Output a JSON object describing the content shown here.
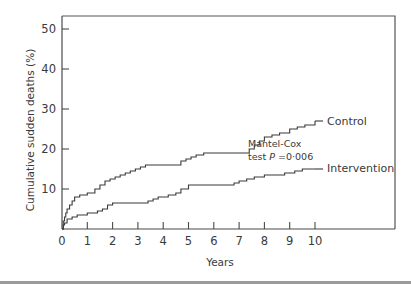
{
  "chart_data": {
    "type": "line",
    "step": true,
    "title": "",
    "xlabel": "Years",
    "ylabel": "Cumulative sudden deaths (%)",
    "xlim": [
      0,
      13.3
    ],
    "ylim": [
      0,
      53
    ],
    "xticks": [
      0,
      1,
      2,
      3,
      4,
      5,
      6,
      7,
      8,
      9,
      10
    ],
    "xtick_labels": [
      "0",
      "1",
      "2",
      "3",
      "4",
      "5",
      "6",
      "7",
      "8",
      "9",
      "10"
    ],
    "yticks": [
      10,
      20,
      30,
      40,
      50
    ],
    "ytick_labels": [
      "10",
      "20",
      "30",
      "40",
      "50"
    ],
    "grid": false,
    "series": [
      {
        "name": "Control",
        "x": [
          0,
          0.05,
          0.1,
          0.15,
          0.2,
          0.3,
          0.4,
          0.5,
          0.7,
          1.0,
          1.3,
          1.5,
          1.7,
          1.9,
          2.1,
          2.3,
          2.5,
          2.7,
          2.9,
          3.1,
          3.3,
          3.5,
          4.7,
          4.9,
          5.1,
          5.3,
          5.6,
          5.9,
          7.4,
          7.6,
          7.8,
          8.0,
          8.3,
          8.6,
          9.0,
          9.3,
          9.6,
          10.0
        ],
        "y": [
          0,
          2,
          3,
          4,
          5,
          6,
          7,
          8,
          8.5,
          9,
          10,
          11,
          12,
          12.5,
          13,
          13.5,
          14,
          14.5,
          15,
          15.5,
          16,
          16,
          17,
          17.5,
          18,
          18.5,
          19,
          19,
          20,
          21,
          22,
          23,
          23.5,
          24,
          25,
          25.5,
          26,
          27
        ]
      },
      {
        "name": "Intervention",
        "x": [
          0,
          0.05,
          0.1,
          0.2,
          0.4,
          0.6,
          1.0,
          1.4,
          1.6,
          1.8,
          2.0,
          3.4,
          3.6,
          3.8,
          4.2,
          4.5,
          4.7,
          5.0,
          6.5,
          6.8,
          7.0,
          7.3,
          7.6,
          8.0,
          8.4,
          8.8,
          9.2,
          9.5,
          10.0
        ],
        "y": [
          0,
          1,
          1.5,
          2.5,
          3,
          3.5,
          4,
          4.5,
          5,
          6,
          6.5,
          7,
          7.5,
          8,
          8.5,
          9,
          10,
          11,
          11,
          11.5,
          12,
          12.5,
          13,
          13.5,
          13.5,
          14,
          14.5,
          15,
          15
        ]
      }
    ],
    "series_labels": [
      "Control",
      "Intervention"
    ],
    "annotation": {
      "line1": "Mantel-Cox",
      "line2_prefix": "test ",
      "line2_italic": "P",
      "line2_suffix": " =0·006"
    },
    "legend": "inline-right"
  }
}
